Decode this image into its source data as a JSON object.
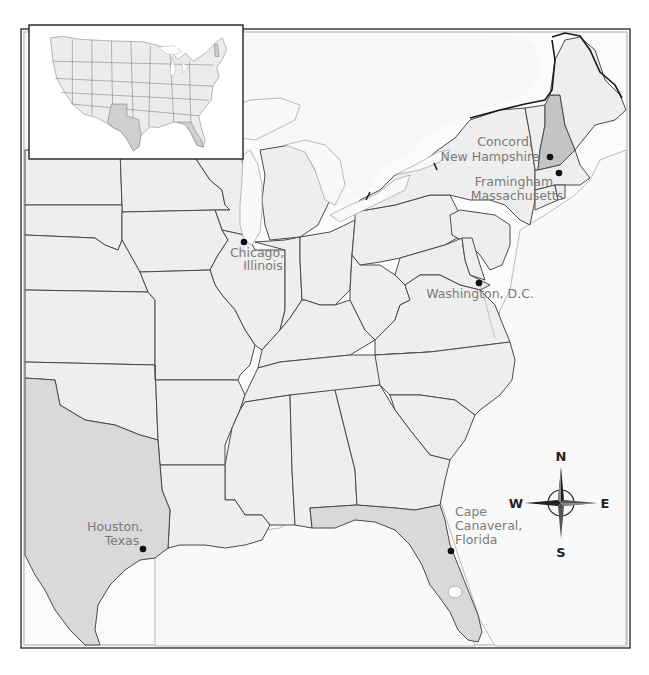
{
  "map": {
    "title": "",
    "frame": {
      "x": 21,
      "y": 29,
      "width": 609,
      "height": 619
    },
    "colors": {
      "land": "#eeeeee",
      "highlight_texas_florida": "#d9d9d9",
      "highlight_new_hampshire": "#c4c4c4",
      "water": "#f9f9f9",
      "label_text": "#7a7a7a",
      "dot": "#111111",
      "border": "#4a4a4a"
    },
    "highlighted_states": [
      "Texas",
      "Florida",
      "New Hampshire"
    ],
    "locations": [
      {
        "id": "concord",
        "line1": "Concord,",
        "line2": "New Hampshire",
        "dot_x": 550,
        "dot_y": 157
      },
      {
        "id": "framingham",
        "line1": "Framingham,",
        "line2": "Massachusetts",
        "dot_x": 559,
        "dot_y": 173
      },
      {
        "id": "chicago",
        "line1": "Chicago,",
        "line2": "Illinois",
        "dot_x": 244,
        "dot_y": 242
      },
      {
        "id": "washington",
        "line1": "Washington, D.C.",
        "line2": "",
        "dot_x": 479,
        "dot_y": 283
      },
      {
        "id": "houston",
        "line1": "Houston,",
        "line2": "Texas",
        "dot_x": 143,
        "dot_y": 549
      },
      {
        "id": "cape-canaveral",
        "line1": "Cape",
        "line2": "Canaveral,",
        "line3": "Florida",
        "dot_x": 451,
        "dot_y": 551
      }
    ],
    "compass": {
      "icon": "compass-rose-icon",
      "north": "N",
      "south": "S",
      "east": "E",
      "west": "W",
      "center_x": 561,
      "center_y": 503
    },
    "inset": {
      "description": "Contiguous United States locator map",
      "highlighted_states": [
        "Texas",
        "Florida",
        "New Hampshire"
      ]
    }
  }
}
